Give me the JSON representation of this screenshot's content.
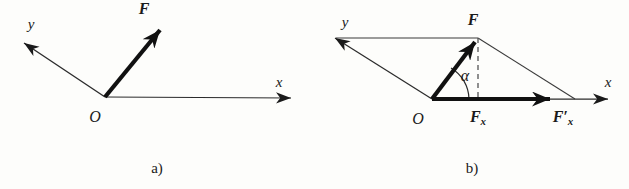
{
  "figure": {
    "kind": "vector-decomposition-diagram",
    "background_color": "#fdfdfb",
    "stroke_color": "#1a1a1a",
    "thin_stroke_color": "#3a3a3a"
  },
  "panel_a": {
    "caption": "a)",
    "axis_x_label": "x",
    "axis_y_label": "y",
    "origin_label": "O",
    "force_label": "F",
    "geometry": {
      "origin": [
        105,
        97
      ],
      "x_axis_tip": [
        293,
        98
      ],
      "y_axis_tip": [
        22,
        42
      ],
      "force_tip": [
        163,
        26
      ]
    }
  },
  "panel_b": {
    "caption": "b)",
    "axis_x_label": "x",
    "axis_y_label": "y",
    "origin_label": "O",
    "force_label": "F",
    "angle_label": "α",
    "component_label": "F",
    "component_sub": "x",
    "component_prime_label": "F",
    "component_prime_sub": "x",
    "component_prime_mark": "′",
    "geometry": {
      "origin": [
        432,
        99
      ],
      "x_axis_tip": [
        610,
        99
      ],
      "y_axis_tip": [
        333,
        37
      ],
      "force_tip": [
        478,
        38
      ],
      "parallelogram_corner": [
        575,
        99
      ],
      "projection_foot": [
        478,
        99
      ]
    }
  }
}
